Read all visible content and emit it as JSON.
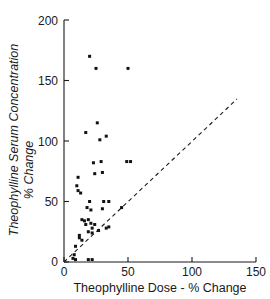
{
  "chart_data": {
    "type": "scatter",
    "title": "",
    "xlabel": "Theophylline Dose - % Change",
    "ylabel": "Theophylline Serum Concentration % Change",
    "ylabel_line1": "Theophylline Serum Concentration",
    "ylabel_line2": "% Change",
    "xlim": [
      0,
      150
    ],
    "ylim": [
      0,
      200
    ],
    "xticks": [
      0,
      50,
      100,
      150
    ],
    "yticks": [
      0,
      50,
      100,
      150,
      200
    ],
    "xtick_labels": [
      "0",
      "50",
      "100",
      "150"
    ],
    "ytick_labels": [
      "0",
      "50",
      "100",
      "150",
      "200"
    ],
    "grid": false,
    "legend": "none",
    "marker": "filled-square",
    "series": [
      {
        "name": "Patients",
        "points": [
          [
            20,
            170
          ],
          [
            25,
            160
          ],
          [
            50,
            160
          ],
          [
            17,
            107
          ],
          [
            26,
            115
          ],
          [
            28,
            101
          ],
          [
            33,
            104
          ],
          [
            23,
            82
          ],
          [
            29,
            83
          ],
          [
            49,
            83
          ],
          [
            52,
            83
          ],
          [
            24,
            73
          ],
          [
            30,
            74
          ],
          [
            11,
            70
          ],
          [
            10,
            63
          ],
          [
            11,
            59
          ],
          [
            13,
            57
          ],
          [
            20,
            50
          ],
          [
            31,
            50
          ],
          [
            35,
            50
          ],
          [
            18,
            45
          ],
          [
            21,
            43
          ],
          [
            30,
            44
          ],
          [
            45,
            45
          ],
          [
            14,
            35
          ],
          [
            16,
            34
          ],
          [
            19,
            35
          ],
          [
            21,
            32
          ],
          [
            17,
            31
          ],
          [
            24,
            31
          ],
          [
            22,
            28
          ],
          [
            27,
            26
          ],
          [
            33,
            28
          ],
          [
            35,
            29
          ],
          [
            12,
            22
          ],
          [
            19,
            25
          ],
          [
            22,
            24
          ],
          [
            9,
            13
          ],
          [
            12,
            20
          ],
          [
            14,
            18
          ],
          [
            8,
            6
          ],
          [
            7,
            3
          ],
          [
            9,
            2
          ],
          [
            19,
            2
          ],
          [
            22,
            2
          ]
        ]
      }
    ],
    "reference_line": {
      "name": "identity-line",
      "style": "dashed",
      "from": [
        0,
        0
      ],
      "to": [
        135,
        135
      ],
      "description": "line of identity (y = x)"
    }
  }
}
